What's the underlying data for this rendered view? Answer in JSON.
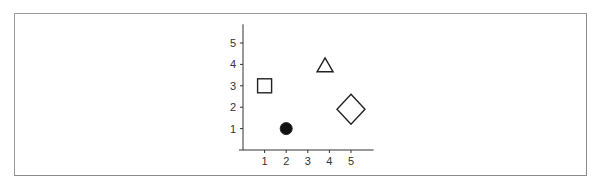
{
  "chart_data": {
    "type": "scatter",
    "title": "",
    "xlabel": "",
    "ylabel": "",
    "xlim": [
      0,
      6
    ],
    "ylim": [
      0,
      5.5
    ],
    "grid": false,
    "legend": null,
    "x_ticks": [
      "1",
      "2",
      "3",
      "4",
      "5"
    ],
    "y_ticks": [
      "1",
      "2",
      "3",
      "4",
      "5"
    ],
    "points": [
      {
        "shape": "square",
        "filled": false,
        "x": 1,
        "y": 3,
        "size": "medium"
      },
      {
        "shape": "circle",
        "filled": true,
        "x": 2,
        "y": 1,
        "size": "medium"
      },
      {
        "shape": "triangle",
        "filled": false,
        "x": 3.8,
        "y": 3.7,
        "size": "medium"
      },
      {
        "shape": "diamond",
        "filled": false,
        "x": 5,
        "y": 1.9,
        "size": "large"
      }
    ]
  },
  "colors": {
    "axis": "#333333",
    "marker_stroke": "#222222",
    "marker_fill": "#111111",
    "frame": "#9a9a9a"
  }
}
